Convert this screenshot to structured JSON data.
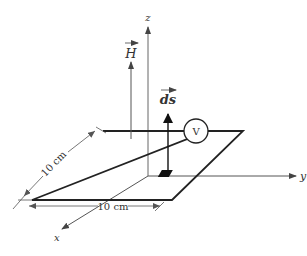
{
  "figure": {
    "type": "physics-diagram"
  },
  "axes": {
    "x_label": "x",
    "y_label": "y",
    "z_label": "z"
  },
  "vectors": {
    "field_label": "H",
    "area_element_label": "ds"
  },
  "loop": {
    "side_x_label": "10 cm",
    "side_y_label": "10 cm"
  },
  "voltmeter": {
    "label": "V"
  },
  "colors": {
    "line": "#222222",
    "axis": "#555555",
    "text": "#333333",
    "background": "#ffffff"
  }
}
